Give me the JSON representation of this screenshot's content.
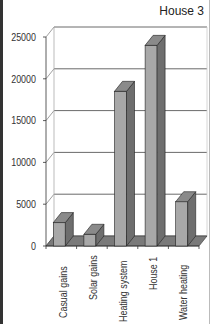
{
  "chart_data": {
    "type": "bar",
    "title": "House 3",
    "xlabel": "",
    "ylabel": "",
    "categories": [
      "Casual gains",
      "Solar gains",
      "Heating system",
      "House 1",
      "Water heating"
    ],
    "values": [
      2800,
      1400,
      18500,
      24000,
      5300
    ],
    "ylim": [
      0,
      25000
    ],
    "yticks": [
      "25000",
      "20000",
      "15000",
      "10000",
      "5000",
      "0"
    ],
    "grid": true,
    "legend": false,
    "style": "3d-column",
    "colors": {
      "bar_front": "#a8a8a8",
      "bar_side": "#6e6e6e",
      "bar_top": "#8a8a8a",
      "floor": "#7a7a7a",
      "grid": "#444444"
    }
  }
}
